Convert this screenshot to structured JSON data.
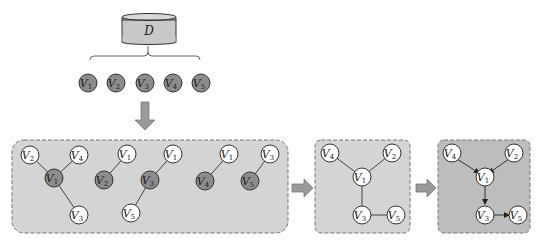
{
  "database": {
    "label": "D",
    "fill": "#c8c8c8"
  },
  "variables": [
    {
      "id": "V1",
      "letter": "V",
      "sub": "1"
    },
    {
      "id": "V2",
      "letter": "V",
      "sub": "2"
    },
    {
      "id": "V3",
      "letter": "V",
      "sub": "3"
    },
    {
      "id": "V4",
      "letter": "V",
      "sub": "4"
    },
    {
      "id": "V5",
      "letter": "V",
      "sub": "5"
    }
  ],
  "stage1": {
    "description": "Local structures per target variable (skeletons)",
    "groups": [
      {
        "target": "V1",
        "neighbors": [
          "V2",
          "V4",
          "V3"
        ]
      },
      {
        "target": "V2",
        "neighbors": [
          "V1"
        ]
      },
      {
        "target": "V3",
        "neighbors": [
          "V1",
          "V5"
        ]
      },
      {
        "target": "V4",
        "neighbors": [
          "V1"
        ]
      },
      {
        "target": "V5",
        "neighbors": [
          "V3"
        ]
      }
    ]
  },
  "stage2": {
    "description": "Merged undirected skeleton",
    "edges": [
      [
        "V4",
        "V1"
      ],
      [
        "V2",
        "V1"
      ],
      [
        "V1",
        "V3"
      ],
      [
        "V3",
        "V5"
      ]
    ]
  },
  "stage3": {
    "description": "Oriented DAG",
    "edges": [
      [
        "V4",
        "V1"
      ],
      [
        "V2",
        "V1"
      ],
      [
        "V1",
        "V3"
      ],
      [
        "V3",
        "V5"
      ]
    ]
  },
  "colors": {
    "box_light": "#d4d4d4",
    "box_dark": "#bdbdbd",
    "node_gray": "#8c8c8c",
    "node_white": "#ffffff",
    "arrow": "#9a9a9a",
    "stroke": "#333333"
  },
  "labels": {
    "D": "D",
    "V": "V",
    "s1": "1",
    "s2": "2",
    "s3": "3",
    "s4": "4",
    "s5": "5"
  }
}
